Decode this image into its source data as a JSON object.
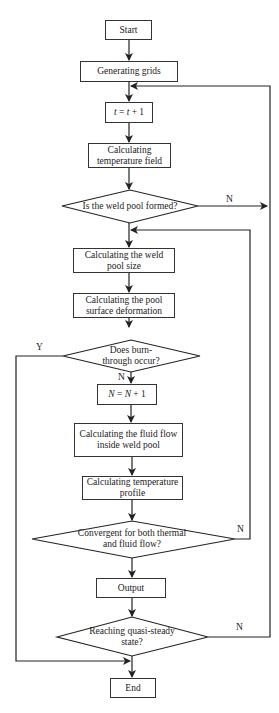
{
  "flowchart": {
    "nodes": [
      {
        "id": "start",
        "type": "process",
        "label": "Start"
      },
      {
        "id": "grids",
        "type": "process",
        "label": "Generating grids"
      },
      {
        "id": "t_inc",
        "type": "process",
        "label": "t = t + 1"
      },
      {
        "id": "temp_field",
        "type": "process",
        "label": "Calculating temperature field"
      },
      {
        "id": "pool_formed",
        "type": "decision",
        "label": "Is the weld pool formed?"
      },
      {
        "id": "pool_size",
        "type": "process",
        "label": "Calculating the weld pool size"
      },
      {
        "id": "surface_def",
        "type": "process",
        "label": "Calculating the pool surface deformation"
      },
      {
        "id": "burn_through",
        "type": "decision",
        "label": "Does burn-through occur?"
      },
      {
        "id": "n_inc",
        "type": "process",
        "label": "N = N + 1"
      },
      {
        "id": "fluid_flow",
        "type": "process",
        "label": "Calculating the fluid flow inside weld pool"
      },
      {
        "id": "temp_profile",
        "type": "process",
        "label": "Calculating temperature profile"
      },
      {
        "id": "convergent",
        "type": "decision",
        "label": "Convergent for both thermal and fluid flow?"
      },
      {
        "id": "output",
        "type": "process",
        "label": "Output"
      },
      {
        "id": "quasi_steady",
        "type": "decision",
        "label": "Reaching quasi-steady state?"
      },
      {
        "id": "end",
        "type": "process",
        "label": "End"
      }
    ],
    "edge_labels": {
      "pool_formed_no": "N",
      "burn_through_yes": "Y",
      "burn_through_no": "N",
      "convergent_no": "N",
      "quasi_steady_no": "N"
    },
    "display": {
      "start": "Start",
      "grids": "Generating grids",
      "t_inc_lhs": "t",
      "t_inc_rhs": " = ",
      "t_inc_var": "t",
      "t_inc_tail": " + 1",
      "temp_field_1": "Calculating",
      "temp_field_2": "temperature field",
      "pool_formed": "Is the weld pool formed?",
      "pool_size_1": "Calculating the weld",
      "pool_size_2": "pool size",
      "surface_def_1": "Calculating the pool",
      "surface_def_2": "surface deformation",
      "burn_1": "Does burn-",
      "burn_2": "through occur?",
      "n_inc_lhs": "N",
      "n_inc_rhs": " = ",
      "n_inc_var": "N",
      "n_inc_tail": " + 1",
      "fluid_1": "Calculating the fluid flow",
      "fluid_2": "inside weld pool",
      "profile_1": "Calculating temperature",
      "profile_2": "profile",
      "conv_1": "Convergent for both thermal",
      "conv_2": "and fluid flow?",
      "output": "Output",
      "steady_1": "Reaching quasi-steady",
      "steady_2": "state?",
      "end": "End"
    }
  }
}
